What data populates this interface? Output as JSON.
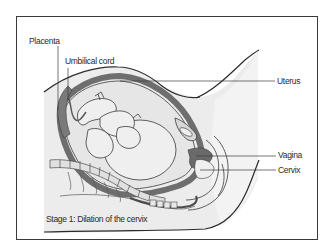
{
  "diagram": {
    "type": "anatomical-illustration",
    "caption": "Stage 1: Dilation of the cervix",
    "labels": [
      {
        "id": "placenta",
        "text": "Placenta"
      },
      {
        "id": "umbilical-cord",
        "text": "Umbilical cord"
      },
      {
        "id": "uterus",
        "text": "Uterus"
      },
      {
        "id": "vagina",
        "text": "Vagina"
      },
      {
        "id": "cervix",
        "text": "Cervix"
      }
    ],
    "colors": {
      "frame": "#3a3a3a",
      "body_fill": "#ececec",
      "uterine_wall": "#6e6e6e",
      "outline": "#2a2a2a",
      "background": "#ffffff"
    }
  }
}
